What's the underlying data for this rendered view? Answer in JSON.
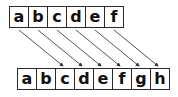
{
  "diagram": {
    "top_row": {
      "cells": [
        "a",
        "b",
        "c",
        "d",
        "e",
        "f"
      ]
    },
    "bottom_row": {
      "cells": [
        "a",
        "b",
        "c",
        "d",
        "e",
        "f",
        "g",
        "h"
      ]
    },
    "arrows": [
      {
        "from": "top.a",
        "to": "bottom.c"
      },
      {
        "from": "top.b",
        "to": "bottom.d"
      },
      {
        "from": "top.c",
        "to": "bottom.e"
      },
      {
        "from": "top.d",
        "to": "bottom.f"
      },
      {
        "from": "top.e",
        "to": "bottom.g"
      },
      {
        "from": "top.f",
        "to": "bottom.h"
      }
    ],
    "colors": {
      "stroke": "#2a2a2a",
      "text": "#111111",
      "background": "#ffffff"
    }
  }
}
